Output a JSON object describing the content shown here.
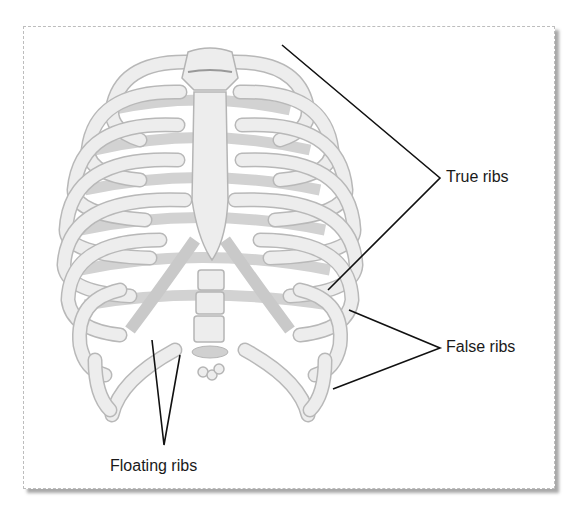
{
  "diagram": {
    "labels": {
      "true_ribs": "True ribs",
      "false_ribs": "False ribs",
      "floating_ribs": "Floating ribs"
    },
    "colors": {
      "bone_fill": "#ececec",
      "bone_stroke": "#b5b5b5",
      "cartilage_fill": "#d6d6d6",
      "leader_line": "#111111",
      "frame_shadow": "#a8a8a8"
    }
  }
}
